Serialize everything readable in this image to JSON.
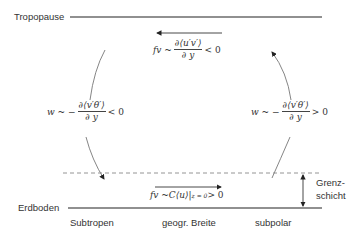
{
  "levels": {
    "top": "Tropopause",
    "bottom": "Erdboden"
  },
  "boundary_layer": {
    "line1": "Grenz-",
    "line2": "schicht"
  },
  "x_labels": {
    "left": "Subtropen",
    "center": "geogr. Breite",
    "right": "subpolar"
  },
  "formulas": {
    "top": {
      "lhs": "fv ~",
      "numerator": "∂⟨u′v′⟩",
      "denominator": "∂ y",
      "rel": "< 0"
    },
    "left": {
      "lhs": "w ~ −",
      "numerator": "∂⟨v′θ′⟩",
      "denominator": "∂ y",
      "rel": "< 0"
    },
    "right": {
      "lhs": "w ~ −",
      "numerator": "∂⟨v′θ′⟩",
      "denominator": "∂ y",
      "rel": "> 0"
    },
    "bottom": {
      "lhs": "fv ~C⟨u⟩|",
      "subscript": "z = 0",
      "rel": " > 0"
    }
  },
  "colors": {
    "line": "#222222",
    "arc": "#666666",
    "dashed": "#888888"
  }
}
